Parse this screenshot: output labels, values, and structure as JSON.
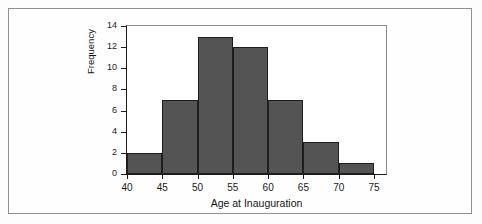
{
  "chart_data": {
    "type": "bar",
    "title": "",
    "subtitle": "",
    "xlabel": "Age at Inauguration",
    "ylabel": "Frequency",
    "categories": [
      "40-45",
      "45-50",
      "50-55",
      "55-60",
      "60-65",
      "65-70",
      "70-75"
    ],
    "bin_edges": [
      40,
      45,
      50,
      55,
      60,
      65,
      70,
      75
    ],
    "values": [
      2,
      7,
      13,
      12,
      7,
      3,
      1
    ],
    "bin_width": 5,
    "xlim": [
      40,
      75
    ],
    "ylim": [
      0,
      14
    ],
    "x_ticks": [
      "40",
      "45",
      "50",
      "55",
      "60",
      "65",
      "70",
      "75"
    ],
    "y_ticks": [
      "0",
      "2",
      "4",
      "6",
      "8",
      "10",
      "12",
      "14"
    ],
    "grid": false,
    "legend": "none",
    "bar_color": "#545454",
    "bar_edge_color": "#1e1e1e",
    "plot_background": "#ffffff",
    "axis_color": "#1d1d1d"
  },
  "figure": {
    "border_color": "#8e9094",
    "page_background": "#fdfdfd"
  }
}
